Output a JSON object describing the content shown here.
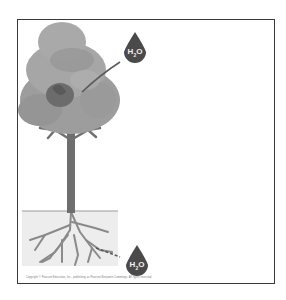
{
  "diagram": {
    "labels": {
      "top_droplet": {
        "main": "H",
        "sub": "2",
        "tail": "O"
      },
      "bottom_droplet": {
        "main": "H",
        "sub": "2",
        "tail": "O"
      }
    },
    "caption": "Copyright © Pearson Education, Inc., publishing as Pearson Benjamin Cummings. All rights reserved.",
    "colors": {
      "foliage_light": "#a8a8a8",
      "foliage_dark": "#7a7a7a",
      "trunk": "#6e6e6e",
      "soil": "#ececec",
      "droplet": "#4a4a4a",
      "frame": "#3a3a3a"
    }
  }
}
